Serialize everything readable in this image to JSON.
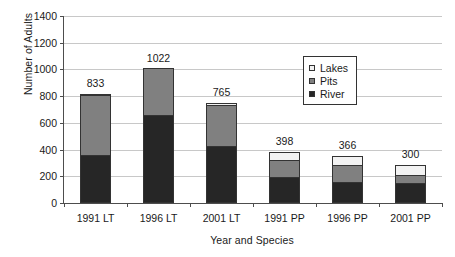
{
  "chart_data": {
    "type": "bar",
    "barmode": "stacked",
    "title": "",
    "xlabel": "Year and Species",
    "ylabel": "Number of Adults",
    "categories": [
      "1991 LT",
      "1996 LT",
      "2001 LT",
      "1991 PP",
      "1996 PP",
      "2001 PP"
    ],
    "series": [
      {
        "name": "River",
        "color": "#262626",
        "values": [
          360,
          660,
          430,
          195,
          160,
          150
        ]
      },
      {
        "name": "Pits",
        "color": "#808080",
        "values": [
          458,
          355,
          315,
          135,
          135,
          70
        ]
      },
      {
        "name": "Lakes",
        "color": "#f2f2f2",
        "values": [
          15,
          7,
          20,
          68,
          71,
          80
        ]
      }
    ],
    "totals": [
      833,
      1022,
      765,
      398,
      366,
      300
    ],
    "total_labels": [
      "833",
      "1022",
      "765",
      "398",
      "366",
      "300"
    ],
    "ylim": [
      0,
      1400
    ],
    "ytick_values": [
      0,
      200,
      400,
      600,
      800,
      1000,
      1200,
      1400
    ],
    "ytick_labels": [
      "0",
      "200",
      "400",
      "600",
      "800",
      "1000",
      "1200",
      "1400"
    ],
    "grid": true,
    "grid_axis": "y",
    "legend_position": "upper right inside plot",
    "legend_entries": [
      "Lakes",
      "Pits",
      "River"
    ]
  },
  "legend": {
    "items": [
      {
        "label": "Lakes",
        "swatch": "sw-lakes"
      },
      {
        "label": "Pits",
        "swatch": "sw-pits"
      },
      {
        "label": "River",
        "swatch": "sw-river"
      }
    ]
  }
}
